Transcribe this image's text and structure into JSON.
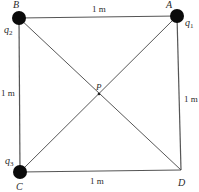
{
  "diagram": {
    "type": "square-charge-configuration",
    "side_length_label": "1 m",
    "points": {
      "A": {
        "label": "A",
        "charge": "q",
        "charge_sub": "1",
        "has_charge": true
      },
      "B": {
        "label": "B",
        "charge": "q",
        "charge_sub": "2",
        "has_charge": true
      },
      "C": {
        "label": "C",
        "charge": "q",
        "charge_sub": "3",
        "has_charge": true
      },
      "D": {
        "label": "D",
        "has_charge": false
      },
      "P": {
        "label": "P",
        "note": "center (intersection of diagonals)"
      }
    },
    "edges": {
      "top": "1 m",
      "left": "1 m",
      "right": "1 m",
      "bottom": "1 m"
    },
    "colors": {
      "charge_fill": "#0a0a0a",
      "line": "#555555",
      "background": "#ffffff"
    }
  }
}
